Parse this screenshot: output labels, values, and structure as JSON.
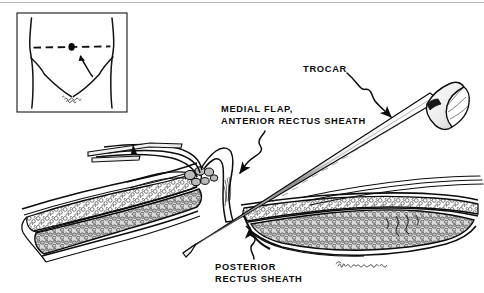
{
  "figure": {
    "domain": "medical-surgical-illustration",
    "width": 484,
    "height": 293,
    "background_color": "#ffffff",
    "ink_color": "#0b0b0b",
    "top_rule_color": "#b9b9b9"
  },
  "labels": {
    "trocar": "TROCAR",
    "medial_flap_line1": "MEDIAL FLAP,",
    "medial_flap_line2": "ANTERIOR RECTUS SHEATH",
    "posterior_line1": "POSTERIOR",
    "posterior_line2": "RECTUS SHEATH"
  },
  "inset": {
    "name": "abdomen-orientation-inset",
    "box": {
      "x": 17,
      "y": 13,
      "width": 110,
      "height": 99
    },
    "contents": [
      "torso-outline",
      "umbilicus-dot",
      "dashed-umbilical-line",
      "inguinal-crease-lines",
      "pubic-hair-hatching",
      "incision-site-arrow"
    ]
  },
  "anatomy": {
    "structures": [
      "skin-surface",
      "subcutaneous-fat",
      "anterior-rectus-sheath",
      "medial-flap-anterior-rectus-sheath",
      "rectus-abdominis-muscle",
      "posterior-rectus-sheath",
      "peritoneum"
    ]
  },
  "instruments": {
    "trocar": {
      "name": "trocar",
      "parts": [
        "flared-handle",
        "shaft",
        "tip"
      ],
      "orientation": "diagonal-upper-right-to-lower-left"
    },
    "retractor_left": {
      "name": "tissue-forceps-left",
      "orientation": "horizontal-from-left"
    },
    "retractor_right": {
      "name": "tissue-forceps-right",
      "orientation": "diagonal-from-right"
    }
  },
  "leaders": [
    {
      "name": "trocar-leader",
      "from": "trocar-label",
      "to": "trocar-shaft",
      "style": "wavy-with-arrowhead"
    },
    {
      "name": "medial-flap-leader",
      "from": "medial-flap-label",
      "to": "medial-flap",
      "style": "wavy-with-arrowhead"
    },
    {
      "name": "posterior-sheath-leader",
      "from": "posterior-label",
      "to": "posterior-rectus-sheath",
      "style": "wavy-with-arrowhead"
    }
  ],
  "signature": {
    "name": "artist-signature",
    "text": ""
  }
}
